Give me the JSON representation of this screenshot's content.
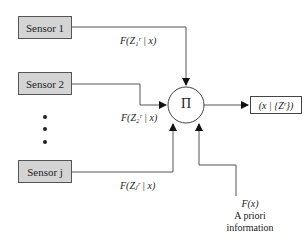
{
  "sensors": [
    {
      "label": "Sensor 1",
      "likelihood": "F(Z₁ʳ | x)"
    },
    {
      "label": "Sensor 2",
      "likelihood": "F(Z₂ʳ | x)"
    },
    {
      "label": "Sensor j",
      "likelihood": "F(Zⱼʳ | x)"
    }
  ],
  "ellipsis": "⋮",
  "fusion_node": {
    "symbol": "Π"
  },
  "output": {
    "label": "(x | {Zʳ})"
  },
  "prior": {
    "function": "F(x)",
    "line1": "A priori",
    "line2": "information"
  },
  "colors": {
    "sensor_fill": "#d4d4d4",
    "line": "#555555"
  }
}
